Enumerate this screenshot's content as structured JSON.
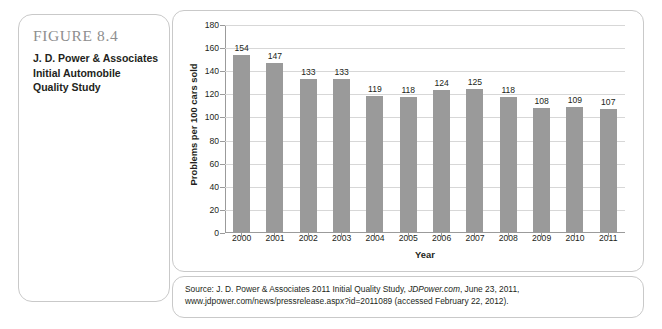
{
  "figure": {
    "number": "FIGURE 8.4",
    "caption_lines": [
      "J. D. Power & Associates",
      "Initial Automobile",
      "Quality Study"
    ]
  },
  "source": {
    "prefix": "Source: J. D. Power & Associates 2011 Initial Quality Study, ",
    "italic": "JDPower.com",
    "suffix": ", June 23, 2011, www.jdpower.com/news/pressrelease",
    "line2": ".aspx?id=2011089 (accessed February 22, 2012)."
  },
  "chart_data": {
    "type": "bar",
    "title": "",
    "xlabel": "Year",
    "ylabel": "Problems per 100 cars sold",
    "categories": [
      "2000",
      "2001",
      "2002",
      "2003",
      "2004",
      "2005",
      "2006",
      "2007",
      "2008",
      "2009",
      "2010",
      "2011"
    ],
    "values": [
      154,
      147,
      133,
      133,
      119,
      118,
      124,
      125,
      118,
      108,
      109,
      107
    ],
    "ylim": [
      0,
      180
    ],
    "ytick_step": 20,
    "yticks": [
      180,
      160,
      140,
      120,
      100,
      80,
      60,
      40,
      20,
      0
    ],
    "grid": true,
    "legend": "none",
    "bar_color": "#9a9a9a",
    "gridline_color": "#d7d7d7",
    "axis_color": "#9b9b9b"
  }
}
